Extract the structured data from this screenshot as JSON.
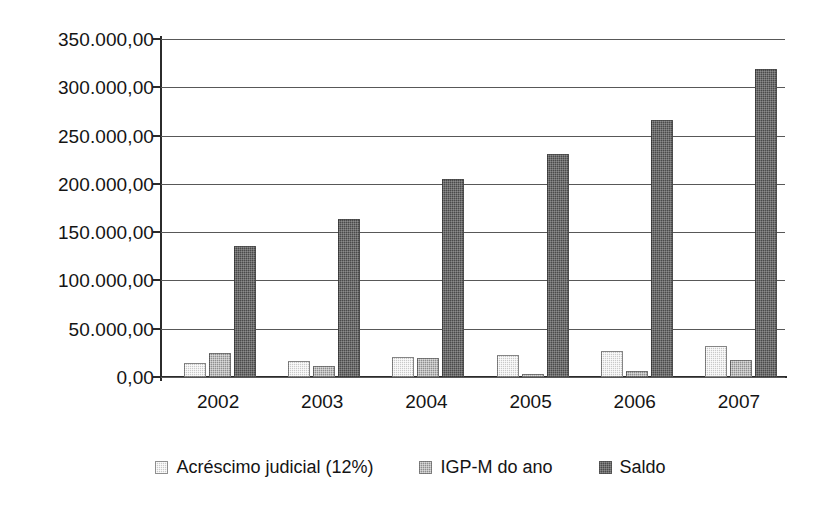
{
  "chart_data": {
    "type": "bar",
    "title": "",
    "subtitle": "",
    "xlabel": "",
    "ylabel": "",
    "categories": [
      "2002",
      "2003",
      "2004",
      "2005",
      "2006",
      "2007"
    ],
    "series": [
      {
        "name": "Acréscimo judicial (12%)",
        "color": "#c9c9c9",
        "values": [
          14500,
          16500,
          20700,
          22800,
          27000,
          32000
        ]
      },
      {
        "name": "IGP-M do ano",
        "color": "#8e8e8e",
        "values": [
          24800,
          11500,
          20000,
          3000,
          6500,
          17600
        ]
      },
      {
        "name": "Saldo",
        "color": "#4a4a4a",
        "values": [
          135650,
          163600,
          205000,
          230500,
          266500,
          319000
        ]
      }
    ],
    "ylim": [
      0,
      350000
    ],
    "ytick_values": [
      0,
      50000,
      100000,
      150000,
      200000,
      250000,
      300000,
      350000
    ],
    "ytick_labels": [
      "0,00",
      "50.000,00",
      "100.000,00",
      "150.000,00",
      "200.000,00",
      "250.000,00",
      "300.000,00",
      "350.000,00"
    ],
    "grid": true,
    "legend_position": "bottom",
    "legend_entries": [
      "Acréscimo judicial (12%)",
      "IGP-M do ano",
      "Saldo"
    ]
  }
}
